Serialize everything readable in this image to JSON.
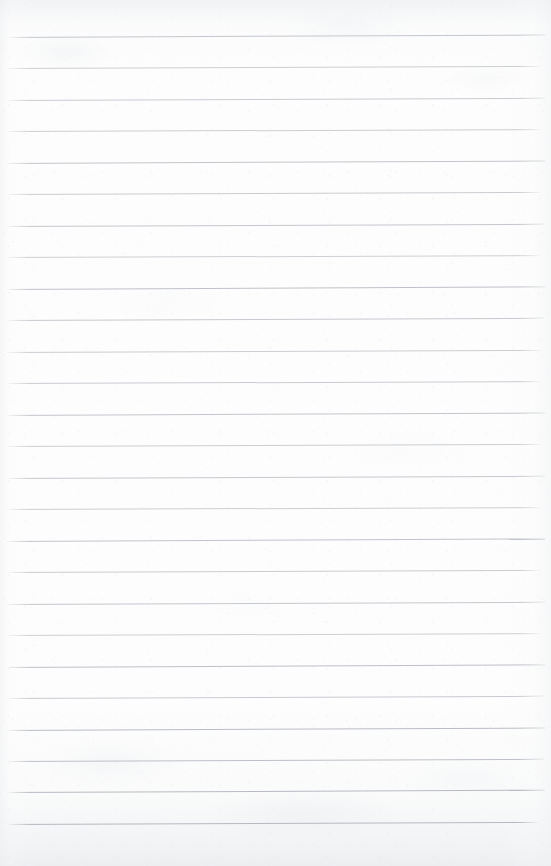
{
  "document": {
    "kind": "scanned-ruled-notebook-page",
    "title": "Blank ruled notebook page",
    "content_text": "",
    "handwriting_present": false,
    "page_width": 551,
    "page_height": 866
  },
  "paper": {
    "background_color": "#fdfdfd",
    "edge_shadow_color": "#e8eaed",
    "texture": "mottled off-white scan grain"
  },
  "ruling": {
    "line_color": "#c9ccd1",
    "line_color_dark": "#b4b8be",
    "line_color_light": "#dcdee2",
    "line_thickness_px": 1,
    "line_count": 26,
    "first_line_y": 37,
    "line_spacing_px": 31.5,
    "left_margin_px": 4,
    "right_edge_px": 543,
    "skew_deg": -0.22,
    "lines": [
      {
        "y": 37,
        "x1": 5,
        "x2": 545,
        "tone": "#c4c7cd",
        "skew": -0.26
      },
      {
        "y": 68,
        "x1": 4,
        "x2": 544,
        "tone": "#cbced3",
        "skew": -0.22
      },
      {
        "y": 100,
        "x1": 5,
        "x2": 545,
        "tone": "#c7cad0",
        "skew": -0.24
      },
      {
        "y": 131,
        "x1": 4,
        "x2": 543,
        "tone": "#ccced3",
        "skew": -0.2
      },
      {
        "y": 163,
        "x1": 4,
        "x2": 545,
        "tone": "#c2c5cb",
        "skew": -0.26
      },
      {
        "y": 194,
        "x1": 5,
        "x2": 544,
        "tone": "#c9ccd1",
        "skew": -0.22
      },
      {
        "y": 226,
        "x1": 4,
        "x2": 545,
        "tone": "#c5c8ce",
        "skew": -0.24
      },
      {
        "y": 257,
        "x1": 4,
        "x2": 543,
        "tone": "#cdd0d5",
        "skew": -0.2
      },
      {
        "y": 289,
        "x1": 5,
        "x2": 545,
        "tone": "#bfc2c9",
        "skew": -0.28
      },
      {
        "y": 320,
        "x1": 4,
        "x2": 544,
        "tone": "#c6c9cf",
        "skew": -0.24
      },
      {
        "y": 352,
        "x1": 4,
        "x2": 545,
        "tone": "#cacdd2",
        "skew": -0.22
      },
      {
        "y": 383,
        "x1": 5,
        "x2": 543,
        "tone": "#c8cbd1",
        "skew": -0.2
      },
      {
        "y": 415,
        "x1": 4,
        "x2": 545,
        "tone": "#c3c6cc",
        "skew": -0.26
      },
      {
        "y": 446,
        "x1": 4,
        "x2": 544,
        "tone": "#cbced3",
        "skew": -0.22
      },
      {
        "y": 478,
        "x1": 5,
        "x2": 545,
        "tone": "#c6c9cf",
        "skew": -0.24
      },
      {
        "y": 509,
        "x1": 4,
        "x2": 543,
        "tone": "#ccced3",
        "skew": -0.2
      },
      {
        "y": 541,
        "x1": 4,
        "x2": 545,
        "tone": "#c1c4cb",
        "skew": -0.27
      },
      {
        "y": 572,
        "x1": 5,
        "x2": 544,
        "tone": "#c9ccd1",
        "skew": -0.22
      },
      {
        "y": 604,
        "x1": 4,
        "x2": 545,
        "tone": "#c5c8ce",
        "skew": -0.24
      },
      {
        "y": 635,
        "x1": 4,
        "x2": 543,
        "tone": "#cdd0d5",
        "skew": -0.2
      },
      {
        "y": 667,
        "x1": 5,
        "x2": 545,
        "tone": "#bec1c8",
        "skew": -0.28
      },
      {
        "y": 698,
        "x1": 4,
        "x2": 544,
        "tone": "#c7cad0",
        "skew": -0.23
      },
      {
        "y": 730,
        "x1": 4,
        "x2": 545,
        "tone": "#b9bdc4",
        "skew": -0.26
      },
      {
        "y": 761,
        "x1": 5,
        "x2": 544,
        "tone": "#bcc0c7",
        "skew": -0.24
      },
      {
        "y": 792,
        "x1": 4,
        "x2": 545,
        "tone": "#b7bbc2",
        "skew": -0.25
      },
      {
        "y": 824,
        "x1": 4,
        "x2": 543,
        "tone": "#b5b9c0",
        "skew": -0.22
      }
    ]
  }
}
